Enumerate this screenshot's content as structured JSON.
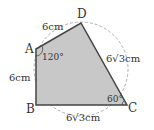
{
  "diagram": {
    "type": "geometry-quadrilateral-inscribed",
    "vertices": {
      "A": {
        "label": "A",
        "x": 36,
        "y": 49
      },
      "B": {
        "label": "B",
        "x": 36,
        "y": 105
      },
      "C": {
        "label": "C",
        "x": 127,
        "y": 105
      },
      "D": {
        "label": "D",
        "x": 81,
        "y": 23
      }
    },
    "side_labels": {
      "AD": "6cm",
      "AB": "6cm",
      "BC": "6√3cm",
      "CD": "6√3cm"
    },
    "angle_labels": {
      "A": "120°",
      "C": "60°"
    },
    "colors": {
      "fill": "#c8c8c8",
      "stroke": "#444444",
      "circle": "#999999",
      "text": "#333333"
    }
  }
}
